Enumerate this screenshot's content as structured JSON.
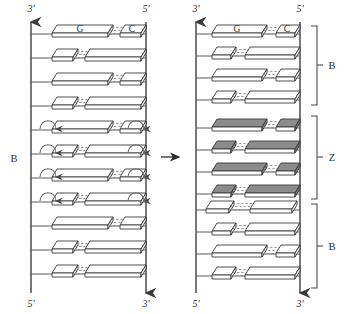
{
  "figure": {
    "type": "diagram",
    "panels": [
      {
        "id": "left",
        "name": "B-form duplex with base-pair flipping",
        "form_label": "B",
        "form_label_position": "left-middle",
        "strand_labels": {
          "top_left": "3'",
          "top_right": "5'",
          "bottom_left": "5'",
          "bottom_right": "3'"
        },
        "arrow_directions": {
          "left_backbone": "up",
          "right_backbone": "down"
        },
        "base_labels": {
          "left": "G",
          "right": "C"
        },
        "rungs": 11,
        "rung_pattern": [
          "wide-left",
          "wide-right",
          "wide-left",
          "wide-right",
          "wide-left",
          "wide-right",
          "wide-left",
          "wide-right",
          "wide-left",
          "wide-right",
          "wide-left"
        ],
        "flip_arrow_rows": [
          5,
          6,
          7,
          8
        ],
        "flip_arrow_note": "curved rotation arrows on both backbones indicating base-pair flip-over",
        "fill": "white"
      },
      {
        "id": "right",
        "name": "B-Z junction duplex",
        "strand_labels": {
          "top_left": "3'",
          "top_right": "5'",
          "bottom_left": "5'",
          "bottom_right": "3'"
        },
        "arrow_directions": {
          "left_backbone": "up",
          "right_backbone": "down"
        },
        "base_labels": {
          "left": "G",
          "right": "C"
        },
        "rungs": 12,
        "rung_pattern": [
          "wide-left",
          "wide-right",
          "wide-left",
          "wide-right",
          "wide-left",
          "wide-right",
          "wide-left",
          "wide-right",
          "junction",
          "wide-right",
          "wide-left",
          "wide-right"
        ],
        "shaded_rows": [
          5,
          6,
          7,
          8,
          9
        ],
        "junction_row": 9,
        "junction_note": "overlapping shaded and unshaded base pairs at the B-Z junction",
        "brackets": [
          {
            "label": "B",
            "start_row": 1,
            "end_row": 4
          },
          {
            "label": "Z",
            "start_row": 5,
            "end_row": 9
          },
          {
            "label": "B",
            "start_row": 9,
            "end_row": 12
          }
        ]
      }
    ],
    "transition_arrow": "→",
    "colors": {
      "stroke": "#333333",
      "backbone": "#444444",
      "block_white": "#ffffff",
      "block_shaded": "#8c8c8c",
      "block_shaded_side": "#6e6e6e",
      "hbond": "#7a7a7a",
      "background": "#ffffff"
    }
  }
}
